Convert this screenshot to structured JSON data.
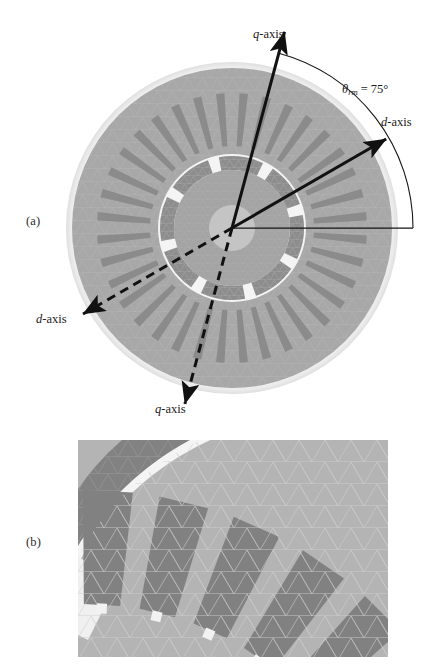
{
  "figure": {
    "type": "technical-figure",
    "panels": [
      {
        "id": "a",
        "label": "(a)",
        "description": "full machine cross-section with d-axis and q-axis direction arrows and rotor position angle"
      },
      {
        "id": "b",
        "label": "(b)",
        "description": "magnified finite-element mesh detail of the rotor magnet, air gap and stator slot region"
      }
    ]
  },
  "annotations": {
    "q_axis_top": {
      "symbol": "q",
      "suffix": "-axis",
      "style": "solid-arrow"
    },
    "d_axis_right": {
      "symbol": "d",
      "suffix": "-axis",
      "style": "solid-arrow"
    },
    "d_axis_lower_left": {
      "symbol": "d",
      "suffix": "-axis",
      "style": "dashed-arrow"
    },
    "q_axis_bottom": {
      "symbol": "q",
      "suffix": "-axis",
      "style": "dashed-arrow"
    },
    "rotor_angle": {
      "symbol": "θ",
      "subscript": "rm",
      "equals": " = ",
      "value": "75°",
      "value_number": 75,
      "unit": "degrees"
    }
  },
  "geometry": {
    "origin": {
      "x": 232,
      "y": 228
    },
    "stator_outer_radius": 160,
    "stator_slot_count": 36,
    "rotor_pole_count": 8,
    "axes": {
      "reference_line_angle_deg": 0,
      "d_axis_angle_deg": 30,
      "q_axis_angle_deg": 75,
      "d_axis_opposite_angle_deg": 210,
      "q_axis_opposite_angle_deg": 255
    }
  },
  "colors": {
    "background": "#ffffff",
    "stator_iron": "#a8a8a8",
    "stator_slot": "#8a8a8a",
    "rotor_iron": "#a0a0a0",
    "magnet": "#888888",
    "shaft": "#c2c2c2",
    "air_gap": "#f2f2f2",
    "mesh_line": "#bdbdbd",
    "annotation_ink": "#1b1b1b",
    "detail_background": "#b4b4b4",
    "detail_dark": "#818181"
  }
}
